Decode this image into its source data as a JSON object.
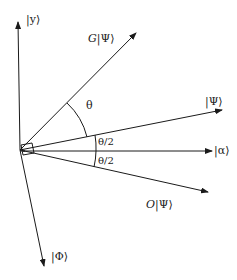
{
  "diagram": {
    "type": "vector-geometry",
    "colors": {
      "stroke": "#1a1a1a",
      "background": "#ffffff"
    },
    "origin": [
      20,
      150
    ],
    "vectors": [
      {
        "name": "y",
        "label": "|y⟩",
        "end": [
          18,
          22
        ]
      },
      {
        "name": "g-psi",
        "label": "G|Ψ⟩",
        "end": [
          136,
          33
        ]
      },
      {
        "name": "psi",
        "label": "|Ψ⟩",
        "end": [
          222,
          110
        ]
      },
      {
        "name": "alpha",
        "label": "|α⟩",
        "end": [
          212,
          151
        ]
      },
      {
        "name": "o-psi",
        "label": "O|Ψ⟩",
        "end": [
          208,
          192
        ]
      },
      {
        "name": "phi",
        "label": "|Φ⟩",
        "end": [
          44,
          266
        ]
      }
    ],
    "angles": [
      {
        "label": "θ",
        "between": [
          "psi",
          "g-psi"
        ]
      },
      {
        "label": "θ/2",
        "between": [
          "alpha",
          "psi"
        ]
      },
      {
        "label": "θ/2",
        "between": [
          "o-psi",
          "alpha"
        ]
      }
    ],
    "labels": {
      "y": "|y⟩",
      "g_prefix": "G",
      "g_ket": "|Ψ⟩",
      "psi": "|Ψ⟩",
      "alpha": "|α⟩",
      "o_prefix": "O",
      "o_ket": "|Ψ⟩",
      "phi": "|Φ⟩",
      "theta": "θ",
      "half_theta_upper": "θ/2",
      "half_theta_lower": "θ/2"
    }
  }
}
